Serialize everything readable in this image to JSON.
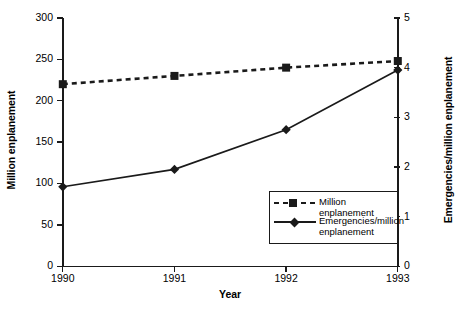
{
  "chart_data": {
    "type": "line",
    "title": "",
    "xlabel": "Year",
    "categories": [
      "1990",
      "1991",
      "1992",
      "1993"
    ],
    "x": [
      1990,
      1991,
      1992,
      1993
    ],
    "grid": false,
    "legend_position": "inside-lower-right",
    "axes": {
      "left": {
        "label": "Million enplanement",
        "ylim": [
          0,
          300
        ],
        "tick_step": 50,
        "ticks": [
          0,
          50,
          100,
          150,
          200,
          250,
          300
        ],
        "tick_labels": [
          "0",
          "50",
          "100",
          "150",
          "200",
          "250",
          "300"
        ]
      },
      "right": {
        "label": "Emergencies/million enplanement",
        "ylim": [
          0,
          5
        ],
        "tick_step": 1,
        "ticks": [
          0,
          1,
          2,
          3,
          4,
          5
        ],
        "tick_labels": [
          "0",
          "1",
          "2",
          "3",
          "4",
          "5"
        ]
      }
    },
    "series": [
      {
        "name": "Million enplanement",
        "axis": "left",
        "marker": "square",
        "linestyle": "dashed",
        "color": "#1a1a1a",
        "values": [
          220,
          230,
          240,
          248
        ]
      },
      {
        "name": "Emergencies/million enplanement",
        "axis": "right",
        "marker": "diamond",
        "linestyle": "solid",
        "color": "#1a1a1a",
        "values": [
          1.6,
          1.95,
          2.75,
          3.95
        ]
      }
    ]
  },
  "legend": {
    "entries": [
      {
        "label": "Million enplanement"
      },
      {
        "label": "Emergencies/million enplanement"
      }
    ]
  }
}
